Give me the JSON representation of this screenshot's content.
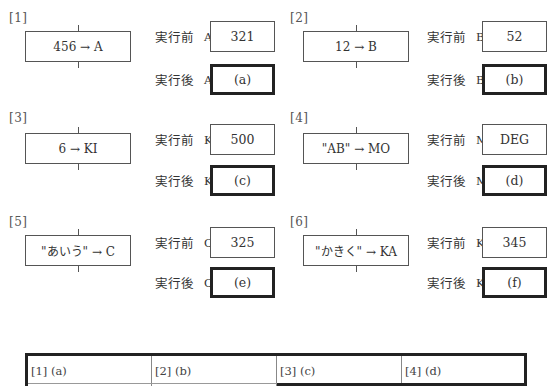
{
  "labels": {
    "before": "実行前",
    "after": "実行後"
  },
  "problems": [
    {
      "number": "[1]",
      "statement": "456 → A",
      "variable": "A",
      "before_value": "321",
      "after_value": "(a)"
    },
    {
      "number": "[2]",
      "statement": "12 → B",
      "variable": "B",
      "before_value": "52",
      "after_value": "(b)"
    },
    {
      "number": "[3]",
      "statement": "6 → KI",
      "variable": "KI",
      "before_value": "500",
      "after_value": "(c)"
    },
    {
      "number": "[4]",
      "statement": "\"AB\" → MO",
      "variable": "MO",
      "before_value": "DEG",
      "after_value": "(d)"
    },
    {
      "number": "[5]",
      "statement": "\"あいう\" → C",
      "variable": "C",
      "before_value": "325",
      "after_value": "(e)"
    },
    {
      "number": "[6]",
      "statement": "\"かきく\" → KA",
      "variable": "KA",
      "before_value": "345",
      "after_value": "(f)"
    }
  ],
  "answer_table": {
    "cells": [
      "[1] (a)",
      "[2] (b)",
      "[3] (c)",
      "[4] (d)"
    ]
  }
}
